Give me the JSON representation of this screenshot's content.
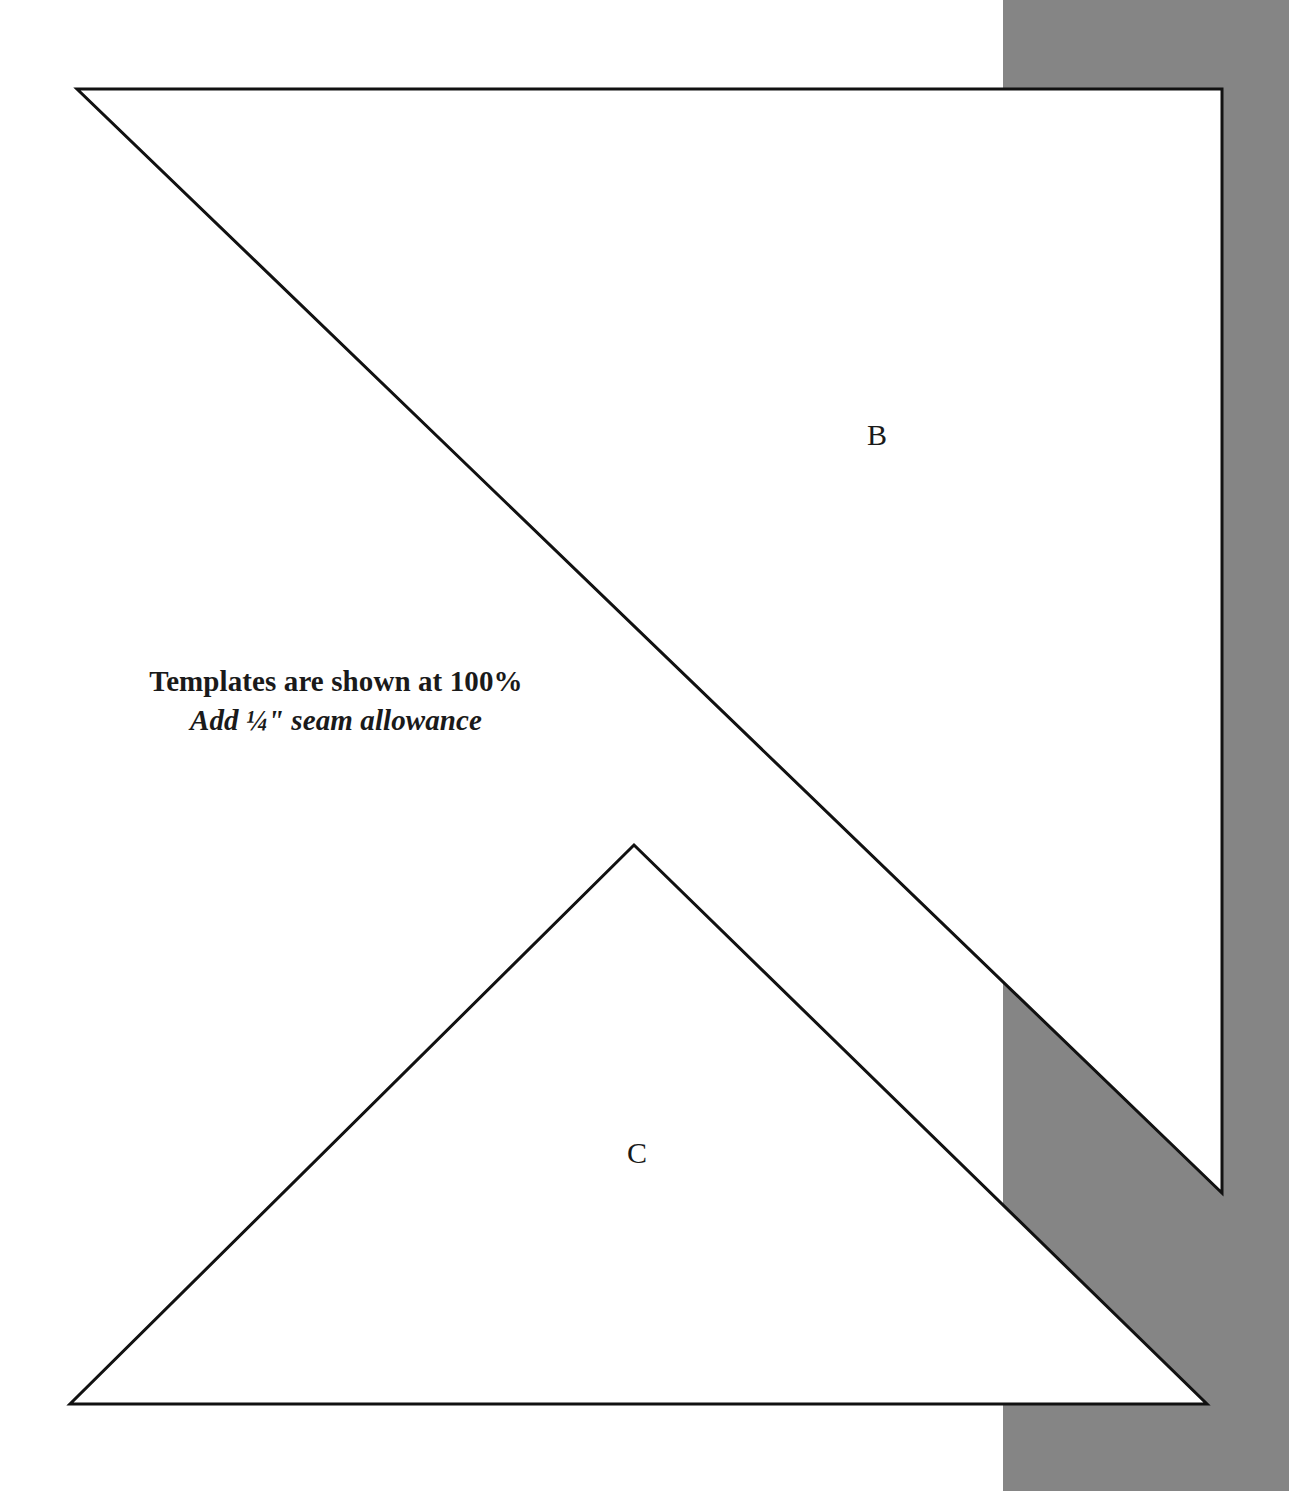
{
  "page": {
    "width": 1289,
    "height": 1491,
    "background_color": "#ffffff",
    "ink_color": "#1a1a1a",
    "stroke_color": "#111111",
    "stroke_width": 3
  },
  "background_band": {
    "name": "gray-vertical-band",
    "color": "#858585",
    "x": 1003,
    "y": 0,
    "width": 286,
    "height": 1491
  },
  "instructions": {
    "line1": "Templates are shown at 100%",
    "line2": "Add ¼\" seam allowance"
  },
  "templates": [
    {
      "id": "B",
      "label": "B",
      "shape": "right-triangle",
      "fill": "#ffffff",
      "points": "77,89 1222,89 1222,1193",
      "label_position": {
        "x": 877,
        "y": 437
      }
    },
    {
      "id": "C",
      "label": "C",
      "shape": "isosceles-triangle",
      "fill": "#ffffff",
      "points": "634,845 1207,1404 70,1404",
      "label_position": {
        "x": 637,
        "y": 1155
      }
    }
  ]
}
